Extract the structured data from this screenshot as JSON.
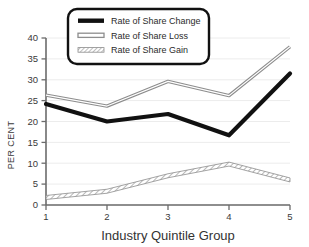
{
  "chart_data": {
    "type": "line",
    "title": "",
    "subtitle": "",
    "xlabel": "Industry Quintile Group",
    "ylabel": "PER CENT",
    "categories": [
      "1",
      "2",
      "3",
      "4",
      "5"
    ],
    "x": [
      1,
      2,
      3,
      4,
      5
    ],
    "xlim": [
      1,
      5
    ],
    "ylim": [
      0,
      40
    ],
    "yticks": [
      0,
      5,
      10,
      15,
      20,
      25,
      30,
      35,
      40
    ],
    "xticks": [
      1,
      2,
      3,
      4,
      5
    ],
    "grid": true,
    "grid_axis": "y",
    "legend_position": "top-center",
    "series": [
      {
        "name": "Rate of Share Change",
        "style": "solid-thick-black",
        "color": "#111111",
        "values": [
          24.2,
          20.0,
          21.8,
          16.7,
          31.5
        ]
      },
      {
        "name": "Rate of Share Loss",
        "style": "double-line-gray",
        "color": "#8d8d8d",
        "values": [
          26.3,
          23.7,
          29.6,
          26.2,
          37.9
        ]
      },
      {
        "name": "Rate of Share Gain",
        "style": "hatched-band",
        "color": "#8d8d8d",
        "values": [
          1.8,
          3.3,
          7.0,
          9.8,
          6.0
        ]
      }
    ]
  },
  "legend": {
    "entries": [
      {
        "label": "Rate of Share Change",
        "swatch": "solid-thick-black"
      },
      {
        "label": "Rate of Share Loss",
        "swatch": "double-line-gray"
      },
      {
        "label": "Rate of Share Gain",
        "swatch": "hatched-band"
      }
    ]
  },
  "axes": {
    "y_title": "PER CENT",
    "x_title": "Industry Quintile Group",
    "y_tick_labels": [
      "0",
      "5",
      "10",
      "15",
      "20",
      "25",
      "30",
      "35",
      "40"
    ],
    "x_tick_labels": [
      "1",
      "2",
      "3",
      "4",
      "5"
    ]
  },
  "colors": {
    "background": "#ffffff",
    "axis": "#6b6b6b",
    "grid": "#e8e8e8",
    "text": "#3a3a3a",
    "series_black": "#111111",
    "series_gray": "#8d8d8d"
  }
}
